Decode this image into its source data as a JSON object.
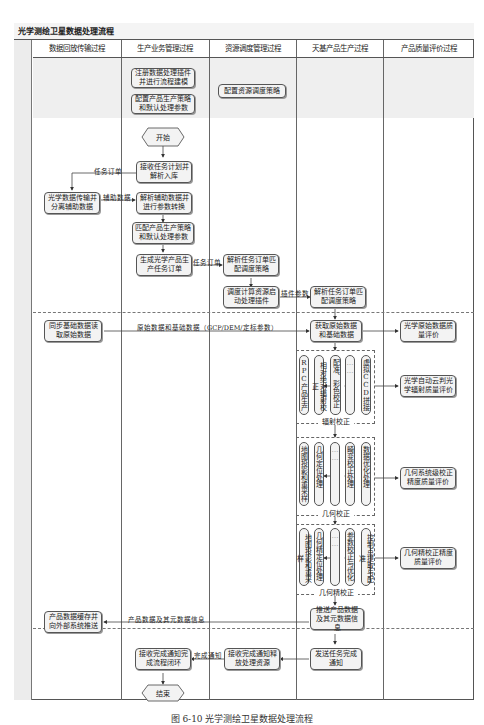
{
  "title": "光学测绘卫星数据处理流程",
  "lanes": [
    "数据回放传输过程",
    "生产业务管理过程",
    "资源调度管理过程",
    "天基产品生产过程",
    "产品质量评价过程"
  ],
  "nodes": {
    "register_plugin": "注册数据处理插件并进行流程建模",
    "config_strategy": "配置产品生产策略和默认处理参数",
    "config_resource": "配置资源调度策略",
    "start": "开始",
    "receive_plan": "接收任务计划并解析入库",
    "transmit_split": "光学数据传输并分离辅助数据",
    "parse_aux": "解析辅助数据并进行参数转换",
    "match_strategy": "匹配产品生产策略和默认处理参数",
    "gen_order": "生成光学产品生产任务订单",
    "parse_order_res": "解析任务订单匹配调度策略",
    "dispatch": "调度计算资源启动处理插件",
    "parse_order_prod": "解析任务订单匹配调度策略",
    "sync_base": "同步基础数据读取原始数据",
    "get_raw": "获取原始数据和基础数据",
    "push_product": "推送产品数据及其元数据信息",
    "store_push": "产品数据缓存并向外部系统推送",
    "send_done": "发送任务完成通知",
    "recv_release": "接收完成通知释放处理资源",
    "recv_close": "接收完成通知完成流程闭环",
    "end": "结束",
    "eval_raw": "光学原始数据质量评价",
    "eval_radiometric": "光学自动云判光学辐射质量评价",
    "eval_geo_sys": "几何系统级校正精度质量评价",
    "eval_geo_fine": "几何精校正精度质量评价"
  },
  "groups": {
    "radiometric": {
      "label": "辐射校正",
      "items": [
        "RPC产品生产",
        "相对绝对辐射校正",
        "配准、彩色校正",
        "……",
        "虚拟CCD拼接"
      ]
    },
    "geometric": {
      "label": "几何校正",
      "items": [
        "地图投影和重采样",
        "几何定位处理",
        "……",
        "畸变校正处理",
        "数据优化处理"
      ]
    },
    "fine_geometric": {
      "label": "几何精校正",
      "items": [
        "地图投影和重采样",
        "几何精定位处理",
        "……",
        "参数校正与优化",
        "控制点提取与配准"
      ]
    }
  },
  "edge_labels": {
    "task_order_1": "任务订单",
    "aux_data": "辅助数据",
    "task_order_2": "任务订单",
    "plugin_params": "插件参数",
    "raw_base": "原始数据和基础数据（GCP/DEM/定标参数）",
    "product_meta": "产品数据及其元数据信息",
    "done_notice": "完成通知"
  },
  "caption": "图 6-10  光学测绘卫星数据处理流程"
}
